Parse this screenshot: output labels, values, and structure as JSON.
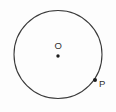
{
  "figure": {
    "kind": "circle-with-center-and-point",
    "background_color": "#fdfdfd",
    "stroke_color": "#3a3a3a",
    "label_color": "#303030",
    "width": 116,
    "height": 112
  },
  "circle": {
    "center_x": 58,
    "center_y": 54.5,
    "radius": 44,
    "stroke_width": 1.1
  },
  "points": [
    {
      "id": "center",
      "label": "O",
      "x": 58,
      "y": 56,
      "dot_radius": 1.7,
      "label_x": 58,
      "label_y": 46
    },
    {
      "id": "on-circle",
      "label": "P",
      "x": 95,
      "y": 80,
      "dot_radius": 2.0,
      "label_x": 101,
      "label_y": 84
    }
  ],
  "edge_fragments": [
    {
      "id": "fragment-top",
      "text": "«",
      "y": 9
    },
    {
      "id": "fragment-middle",
      "text": "·",
      "y": 37
    },
    {
      "id": "fragment-bottom",
      "text": "·",
      "y": 57
    }
  ]
}
